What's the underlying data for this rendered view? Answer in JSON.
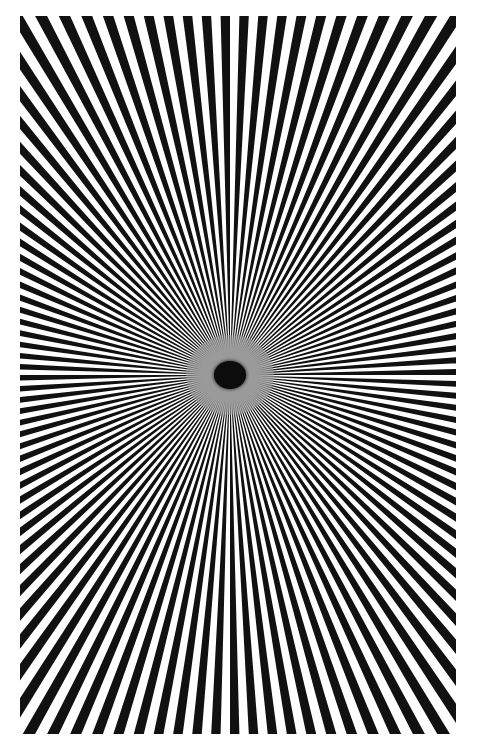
{
  "image": {
    "subject": "Siemens star radial test pattern",
    "frame": {
      "left": 20,
      "top": 16,
      "width": 436,
      "height": 718
    },
    "center": {
      "x": 210,
      "y": 359
    },
    "spoke_count": 120,
    "start_angle_deg": -1.5,
    "colors": {
      "spoke": "#111111",
      "background": "#ffffff",
      "center_spot": "#0c0c0c",
      "halo": "#9a9a9a"
    },
    "center_spot": {
      "rx": 16,
      "ry": 14
    },
    "halo": {
      "rx": 44,
      "ry": 40
    }
  }
}
